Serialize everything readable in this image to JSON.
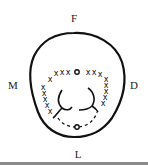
{
  "diagram": {
    "labels": {
      "top": "F",
      "left": "M",
      "right": "D",
      "bottom": "L"
    },
    "marks": {
      "cross_symbol": "x",
      "circle_symbol": "o",
      "upper_arc_crosses_left": 4,
      "upper_arc_crosses_right": 3,
      "left_column_crosses": 5,
      "right_column_crosses": 5,
      "upper_circle_count": 1,
      "lower_circle_count": 1
    },
    "colors": {
      "ink": "#111111",
      "background": "#ffffff",
      "bottom_rule": "#8a8a8a"
    }
  }
}
